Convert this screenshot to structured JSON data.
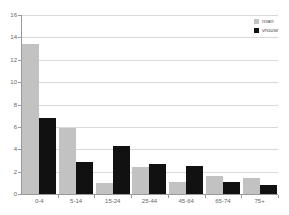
{
  "chart_data": {
    "type": "bar",
    "title": "",
    "subtitle": "",
    "xlabel": "",
    "ylabel": "",
    "categories": [
      "0-4",
      "5-14",
      "15-24",
      "25-44",
      "45-64",
      "65-74",
      "75+"
    ],
    "series": [
      {
        "name": "man",
        "color": "#c2c2c2",
        "values": [
          13.4,
          5.9,
          0.95,
          2.4,
          1.1,
          1.65,
          1.45
        ]
      },
      {
        "name": "vrouw",
        "color": "#111111",
        "values": [
          6.8,
          2.85,
          4.3,
          2.65,
          2.5,
          1.1,
          0.85
        ]
      }
    ],
    "ylim": [
      0,
      16
    ],
    "yticks": [
      0,
      2,
      4,
      6,
      8,
      10,
      12,
      14,
      16
    ],
    "ytick_labels": [
      "0",
      "2",
      "4",
      "6",
      "8",
      "10",
      "12",
      "14",
      "16"
    ],
    "grid": true,
    "grid_axis": "y",
    "legend_position": "top-right",
    "legend_entries": [
      "man",
      "vrouw"
    ]
  },
  "colors": {
    "background": "#ffffff",
    "gridline": "#d9d9d9",
    "axis": "#9a9a9a",
    "tick_text": "#666666",
    "legend_text": "#555555",
    "series_man": "#c2c2c2",
    "series_vrouw": "#111111"
  }
}
